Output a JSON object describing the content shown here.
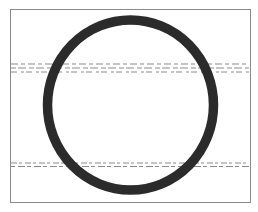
{
  "figure": {
    "frame": {
      "x1": 10,
      "y1": 9,
      "x2": 250,
      "y2": 202,
      "color": "#8a8a8a"
    },
    "ring": {
      "cx": 130.5,
      "cy": 105,
      "rx": 83,
      "ry": 85,
      "stroke_width": 9.5,
      "color": "#2b2b2b"
    },
    "bands": [
      {
        "name": "upper-dashed-band",
        "rows": [
          {
            "y": 64,
            "dash": "7 3 4 3"
          },
          {
            "y": 68,
            "dash": "5 2 8 3"
          },
          {
            "y": 72,
            "dash": "6 4 3 2"
          }
        ],
        "color": "#8c8c8c"
      },
      {
        "name": "lower-dashed-band",
        "rows": [
          {
            "y": 163,
            "dash": "6 2 3 3"
          },
          {
            "y": 166.5,
            "dash": "4 3 7 2"
          }
        ],
        "color": "#8c8c8c"
      }
    ],
    "caption": ""
  }
}
